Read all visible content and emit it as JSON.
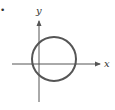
{
  "figure": {
    "type": "circle-on-axes",
    "marker": "•",
    "x_axis_label": "x",
    "y_axis_label": "y",
    "colors": {
      "axis": "#555555",
      "circle": "#555555",
      "label": "#333333"
    },
    "circle": {
      "center_relative_to_origin": "right of y-axis, slightly above x-axis",
      "crosses_both_axes": true
    }
  }
}
